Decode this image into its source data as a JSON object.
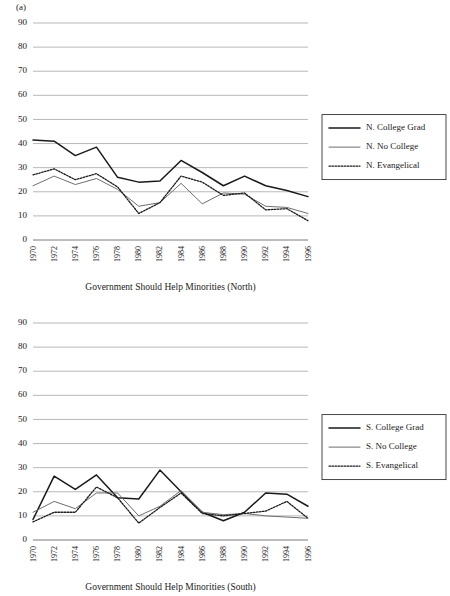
{
  "figure": {
    "panel_label": "(a)"
  },
  "chart_data": [
    {
      "id": "north",
      "type": "line",
      "title": "",
      "xlabel": "Government Should Help Minorities (North)",
      "ylabel": "",
      "ylim": [
        0,
        90
      ],
      "yticks": [
        0,
        10,
        20,
        30,
        40,
        50,
        60,
        70,
        80,
        90
      ],
      "grid": true,
      "legend_position": "right",
      "categories": [
        1970,
        1972,
        1974,
        1976,
        1978,
        1980,
        1982,
        1984,
        1986,
        1988,
        1990,
        1992,
        1994,
        1996
      ],
      "x": [
        "1970",
        "1972",
        "1974",
        "1976",
        "1978",
        "1980",
        "1982",
        "1984",
        "1986",
        "1988",
        "1990",
        "1992",
        "1994",
        "1996"
      ],
      "series": [
        {
          "name": "N. College Grad",
          "style": "solid-thick",
          "color": "#1a1a1a",
          "values": [
            41.5,
            41.0,
            35.0,
            38.5,
            26.0,
            24.0,
            24.5,
            33.0,
            28.0,
            22.5,
            26.5,
            22.5,
            20.5,
            18.0
          ]
        },
        {
          "name": "N. No College",
          "style": "solid-thin",
          "color": "#6e6e6e",
          "values": [
            22.5,
            26.5,
            23.0,
            25.5,
            21.0,
            14.0,
            15.5,
            23.5,
            15.0,
            19.5,
            19.0,
            14.0,
            13.5,
            11.0
          ]
        },
        {
          "name": "N. Evangelical",
          "style": "dotted",
          "color": "#1a1a1a",
          "values": [
            27.0,
            29.5,
            25.0,
            27.5,
            22.0,
            11.0,
            15.5,
            26.5,
            24.0,
            18.5,
            19.5,
            12.5,
            13.0,
            8.0
          ]
        }
      ]
    },
    {
      "id": "south",
      "type": "line",
      "title": "",
      "xlabel": "Government Should Help Minorities (South)",
      "ylabel": "",
      "ylim": [
        0,
        90
      ],
      "yticks": [
        0,
        10,
        20,
        30,
        40,
        50,
        60,
        70,
        80,
        90
      ],
      "grid": true,
      "legend_position": "right",
      "categories": [
        1970,
        1972,
        1974,
        1976,
        1978,
        1980,
        1982,
        1984,
        1986,
        1988,
        1990,
        1992,
        1994,
        1996
      ],
      "x": [
        "1970",
        "1972",
        "1974",
        "1976",
        "1978",
        "1980",
        "1982",
        "1984",
        "1986",
        "1988",
        "1990",
        "1992",
        "1994",
        "1996"
      ],
      "series": [
        {
          "name": "S. College Grad",
          "style": "solid-thick",
          "color": "#1a1a1a",
          "values": [
            8.5,
            26.5,
            21.0,
            27.0,
            17.5,
            17.0,
            29.0,
            20.0,
            11.5,
            8.0,
            11.5,
            19.5,
            19.0,
            14.0
          ]
        },
        {
          "name": "S. No College",
          "style": "solid-thin",
          "color": "#6e6e6e",
          "values": [
            11.5,
            16.0,
            13.0,
            19.5,
            19.5,
            10.0,
            14.0,
            20.5,
            11.5,
            10.5,
            11.0,
            10.0,
            9.5,
            9.0
          ]
        },
        {
          "name": "S. Evangelical",
          "style": "dotted",
          "color": "#1a1a1a",
          "values": [
            7.5,
            11.5,
            11.5,
            22.0,
            17.5,
            7.0,
            13.5,
            19.5,
            11.0,
            10.0,
            11.0,
            12.0,
            16.0,
            9.0
          ]
        }
      ]
    }
  ]
}
